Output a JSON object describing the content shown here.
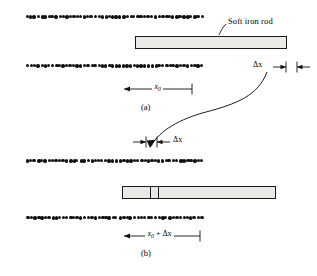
{
  "figure": {
    "title_visible": false,
    "panels": [
      {
        "id": "a",
        "caption": "(a)",
        "rod_label": "Soft iron rod",
        "dimension_main": "x0",
        "dimension_main_base": "x",
        "dimension_main_sub": "0",
        "dimension_gap": "Δx"
      },
      {
        "id": "b",
        "caption": "(b)",
        "dimension_main_base": "x",
        "dimension_main_sub": "0",
        "dimension_main_suffix": " + Δx",
        "dimension_gap": "Δx"
      }
    ],
    "colors": {
      "ink": "#111111",
      "rod_fill": "#e9e9e6",
      "rod_border": "#1a1a1a",
      "background": "#ffffff"
    },
    "icon_names": {
      "coil_dots": "coil-winding-dots",
      "transition_arrow": "curved-transition-arrow",
      "leader": "leader-line"
    }
  },
  "chart_data": {
    "type": "diagram",
    "panel_a": {
      "coil_rows": [
        {
          "name": "upper-winding-row",
          "x_start": 26,
          "x_end": 200,
          "y": 16,
          "count": 50
        },
        {
          "name": "lower-winding-row",
          "x_start": 26,
          "x_end": 200,
          "y": 65,
          "count": 50
        }
      ],
      "rod": {
        "x": 135,
        "y": 36,
        "width": 152,
        "height": 13
      },
      "dimension_x0": {
        "x_left": 124,
        "x_right": 192,
        "y": 89,
        "label": "x0"
      },
      "dimension_dx": {
        "tick_left": 286,
        "tick_right": 297,
        "y": 67,
        "label": "Δx"
      },
      "label_position": {
        "text": "Soft iron rod",
        "x": 228,
        "y": 22
      },
      "caption_position": {
        "text": "(a)",
        "x": 141,
        "y": 108
      }
    },
    "panel_b": {
      "coil_rows": [
        {
          "name": "upper-winding-row",
          "x_start": 26,
          "x_end": 200,
          "y": 160,
          "count": 50
        },
        {
          "name": "lower-winding-row",
          "x_start": 26,
          "x_end": 200,
          "y": 217,
          "count": 50
        }
      ],
      "rod": {
        "x": 122,
        "y": 186,
        "width": 154,
        "height": 13
      },
      "rod_dividers": [
        150,
        158
      ],
      "dimension_dx": {
        "tick_left": 146,
        "tick_right": 157,
        "y": 142,
        "label": "Δx"
      },
      "dimension_x0dx": {
        "x_left": 124,
        "x_right": 200,
        "y": 236,
        "label": "x0 + Δx"
      },
      "caption_position": {
        "text": "(b)",
        "x": 141,
        "y": 253
      }
    },
    "transition_arrow": {
      "from": [
        267,
        72
      ],
      "to": [
        150,
        147
      ]
    }
  }
}
